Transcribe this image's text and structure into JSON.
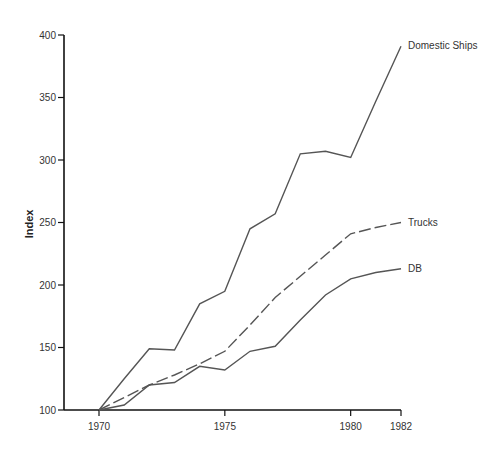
{
  "chart_data": {
    "type": "line",
    "title": "",
    "xlabel": "",
    "ylabel": "Index",
    "ylim": [
      100,
      400
    ],
    "xlim": [
      1970,
      1982
    ],
    "grid": false,
    "y_ticks": [
      100,
      150,
      200,
      250,
      300,
      350,
      400
    ],
    "x_ticks": [
      1970,
      1975,
      1980,
      1982
    ],
    "legend": "direct labels at line ends",
    "series": [
      {
        "name": "Domestic Ships",
        "style": "solid",
        "x": [
          1970,
          1971,
          1972,
          1973,
          1974,
          1975,
          1976,
          1977,
          1978,
          1979,
          1980,
          1981,
          1982
        ],
        "values": [
          100,
          125,
          149,
          148,
          185,
          195,
          245,
          257,
          305,
          307,
          302,
          347,
          391
        ]
      },
      {
        "name": "Trucks",
        "style": "dashed",
        "x": [
          1970,
          1971,
          1972,
          1973,
          1974,
          1975,
          1976,
          1977,
          1978,
          1979,
          1980,
          1981,
          1982
        ],
        "values": [
          100,
          110,
          120,
          128,
          137,
          147,
          168,
          190,
          207,
          224,
          241,
          246,
          250
        ]
      },
      {
        "name": "DB",
        "style": "solid",
        "x": [
          1970,
          1971,
          1972,
          1973,
          1974,
          1975,
          1976,
          1977,
          1978,
          1979,
          1980,
          1981,
          1982
        ],
        "values": [
          100,
          104,
          120,
          122,
          135,
          132,
          147,
          151,
          172,
          192,
          205,
          210,
          213
        ]
      }
    ]
  },
  "labels": {
    "ylabel": "Index",
    "series_ships": "Domestic Ships",
    "series_trucks": "Trucks",
    "series_db": "DB"
  }
}
